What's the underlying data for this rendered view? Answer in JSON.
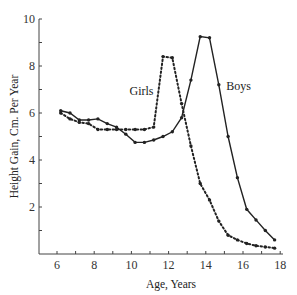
{
  "chart_data": {
    "type": "line",
    "title": "",
    "xlabel": "Age, Years",
    "ylabel": "Height Gain, Cm. Per Year",
    "xlim": [
      5,
      18
    ],
    "ylim": [
      0,
      10
    ],
    "xticks": [
      6,
      8,
      10,
      12,
      14,
      16,
      18
    ],
    "yticks": [
      2,
      4,
      6,
      8,
      10
    ],
    "grid": false,
    "legend": "inline labels",
    "series": [
      {
        "name": "Boys",
        "style": "solid",
        "label_pos": [
          15.1,
          7.0
        ],
        "x": [
          6.2,
          6.7,
          7.2,
          7.7,
          8.2,
          8.7,
          9.2,
          9.7,
          10.2,
          10.7,
          11.2,
          11.7,
          12.2,
          12.7,
          13.2,
          13.7,
          14.2,
          14.7,
          15.2,
          15.7,
          16.2,
          16.7,
          17.2,
          17.7
        ],
        "values": [
          6.1,
          6.0,
          5.7,
          5.7,
          5.75,
          5.55,
          5.4,
          5.1,
          4.75,
          4.75,
          4.85,
          5.0,
          5.2,
          5.8,
          7.4,
          9.25,
          9.2,
          7.2,
          5.0,
          3.25,
          1.9,
          1.45,
          1.0,
          0.6
        ]
      },
      {
        "name": "Girls",
        "style": "dotted",
        "label_pos": [
          9.9,
          6.75
        ],
        "x": [
          6.2,
          6.7,
          7.2,
          7.7,
          8.2,
          8.7,
          9.2,
          9.7,
          10.2,
          10.7,
          11.2,
          11.7,
          12.2,
          12.7,
          13.2,
          13.7,
          14.2,
          14.7,
          15.2,
          15.7,
          16.2,
          16.7,
          17.2,
          17.7
        ],
        "values": [
          6.0,
          5.75,
          5.6,
          5.55,
          5.3,
          5.3,
          5.3,
          5.3,
          5.3,
          5.3,
          5.4,
          8.4,
          8.35,
          6.4,
          4.6,
          3.0,
          2.3,
          1.4,
          0.8,
          0.6,
          0.45,
          0.35,
          0.3,
          0.25
        ]
      }
    ]
  }
}
